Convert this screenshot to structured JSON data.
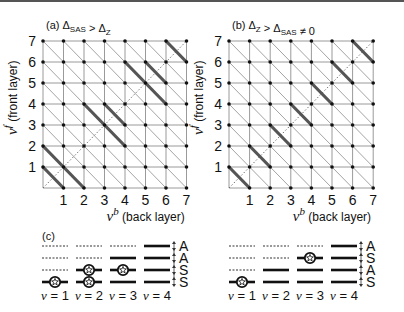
{
  "panels": [
    {
      "id": "a",
      "tag": "(a)",
      "condition": {
        "lhs": "Δ",
        "lhs_sub": "SAS",
        "op": ">",
        "rhs": "Δ",
        "rhs_sub": "Z",
        "tail": ""
      },
      "origin": {
        "x": 43,
        "y": 188
      },
      "step": {
        "x": 20.5,
        "y": 21
      },
      "thick_segments": [
        [
          [
            0,
            1
          ],
          [
            1,
            0
          ]
        ],
        [
          [
            0,
            2
          ],
          [
            2,
            0
          ]
        ],
        [
          [
            2,
            4
          ],
          [
            4,
            2
          ]
        ],
        [
          [
            3,
            4
          ],
          [
            4,
            3
          ]
        ],
        [
          [
            4,
            6
          ],
          [
            6,
            4
          ]
        ],
        [
          [
            5,
            6
          ],
          [
            6,
            5
          ]
        ],
        [
          [
            6,
            7
          ],
          [
            7,
            6
          ]
        ]
      ]
    },
    {
      "id": "b",
      "tag": "(b)",
      "condition": {
        "lhs": "Δ",
        "lhs_sub": "Z",
        "op": ">",
        "rhs": "Δ",
        "rhs_sub": "SAS",
        "tail": "≠ 0"
      },
      "origin": {
        "x": 229,
        "y": 188
      },
      "step": {
        "x": 20.6,
        "y": 21
      },
      "thick_segments": [
        [
          [
            0,
            1
          ],
          [
            1,
            0
          ]
        ],
        [
          [
            1,
            2
          ],
          [
            2,
            1
          ]
        ],
        [
          [
            2,
            3
          ],
          [
            3,
            2
          ]
        ],
        [
          [
            3,
            4
          ],
          [
            4,
            3
          ]
        ],
        [
          [
            4,
            5
          ],
          [
            5,
            4
          ]
        ],
        [
          [
            5,
            6
          ],
          [
            6,
            5
          ]
        ],
        [
          [
            6,
            7
          ],
          [
            7,
            6
          ]
        ]
      ]
    }
  ],
  "axes": {
    "x_ticks": [
      "1",
      "2",
      "3",
      "4",
      "5",
      "6",
      "7"
    ],
    "y_ticks": [
      "1",
      "2",
      "3",
      "4",
      "5",
      "6",
      "7"
    ],
    "x_label_symbol": "ν",
    "x_label_sup": "b",
    "x_label_text": "(back layer)",
    "y_label_symbol": "ν",
    "y_label_sup": "f",
    "y_label_text": "(front layer)"
  },
  "panel_c": {
    "tag": "(c)",
    "left": {
      "x0": 42,
      "columns": [
        {
          "label": "ν = 1",
          "levels": [
            "dotted",
            "dotted",
            "dotted",
            "star"
          ]
        },
        {
          "label": "ν = 2",
          "levels": [
            "dotted",
            "dotted",
            "star",
            "star"
          ]
        },
        {
          "label": "ν = 3",
          "levels": [
            "dotted",
            "solid",
            "star",
            "solid"
          ]
        },
        {
          "label": "ν = 4",
          "levels": [
            "solid",
            "solid",
            "solid",
            "solid"
          ]
        }
      ],
      "symmetry": [
        "A",
        "A",
        "S",
        "S"
      ]
    },
    "right": {
      "x0": 229,
      "columns": [
        {
          "label": "ν = 1",
          "levels": [
            "dotted",
            "dotted",
            "dotted",
            "star"
          ]
        },
        {
          "label": "ν = 2",
          "levels": [
            "dotted",
            "dotted",
            "solid",
            "solid"
          ]
        },
        {
          "label": "ν = 3",
          "levels": [
            "dotted",
            "star",
            "solid",
            "solid"
          ]
        },
        {
          "label": "ν = 4",
          "levels": [
            "solid",
            "solid",
            "solid",
            "solid"
          ]
        }
      ],
      "symmetry": [
        "A",
        "S",
        "A",
        "S"
      ]
    }
  },
  "colors": {
    "grid": "#9a9a9a",
    "thin_diag": "#8c8c8c",
    "thick": "#555555",
    "dot": "#111111"
  }
}
